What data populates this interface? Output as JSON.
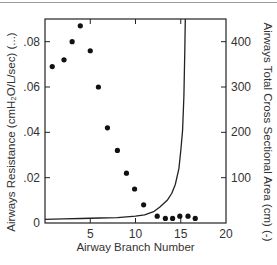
{
  "chart_data": {
    "type": "scatter",
    "title": "",
    "xlabel": "Airway Branch Number",
    "ylabel": "Airways Resistance (cmH2O/L/sec) (...)",
    "ylabel_right": "Airways Total Cross Sectional Area (cm) (-)",
    "xlim": [
      0,
      20
    ],
    "ylim": [
      0,
      0.09
    ],
    "ylim_right": [
      0,
      450
    ],
    "x_ticks": [
      0,
      5,
      10,
      15,
      20
    ],
    "x_tick_labels": [
      "",
      "5",
      "10",
      "15",
      "20"
    ],
    "y_ticks": [
      0,
      0.02,
      0.04,
      0.06,
      0.08
    ],
    "y_tick_labels": [
      "0",
      ".02",
      ".04",
      ".06",
      ".08"
    ],
    "y_right_ticks": [
      100,
      200,
      300,
      400
    ],
    "y_right_tick_labels": [
      "100",
      "200",
      "300",
      "400"
    ],
    "grid": false,
    "legend": null,
    "series": [
      {
        "name": "Airways Resistance",
        "style": "dots",
        "axis": "left",
        "x": [
          0.8,
          2.1,
          3.0,
          3.9,
          5.0,
          5.9,
          6.9,
          8.0,
          9.0,
          9.9,
          10.9,
          12.4,
          13.3,
          14.1,
          14.9,
          15.8,
          16.6
        ],
        "y": [
          0.069,
          0.072,
          0.08,
          0.087,
          0.076,
          0.06,
          0.042,
          0.032,
          0.022,
          0.015,
          0.008,
          0.003,
          0.002,
          0.002,
          0.003,
          0.003,
          0.002
        ]
      },
      {
        "name": "Airways Total Cross Sectional Area",
        "style": "line",
        "axis": "right",
        "x": [
          0,
          2,
          4,
          6,
          8,
          10,
          11,
          12,
          12.7,
          13.5,
          14.0,
          14.4,
          14.8,
          15.0,
          15.2,
          15.35,
          15.45,
          15.5
        ],
        "y": [
          8,
          9,
          10,
          11,
          12,
          15,
          18,
          25,
          35,
          50,
          65,
          85,
          120,
          160,
          205,
          280,
          380,
          450
        ]
      }
    ]
  },
  "labels": {
    "xlabel": "Airway Branch Number",
    "ylabel_left": "Airways Resistance (cmH₂O/L/sec) (...)",
    "ylabel_right": "Airways Total Cross Sectional Area (cm) (-)"
  }
}
